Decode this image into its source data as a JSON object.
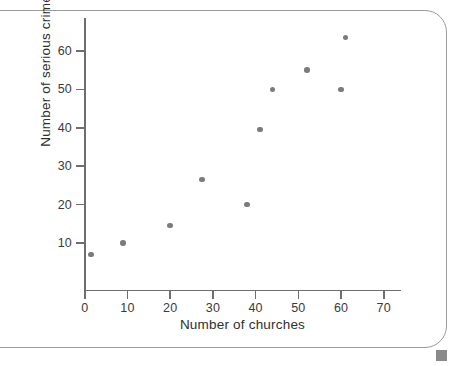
{
  "figure": {
    "frame": {
      "border_color": "#9b9b9b",
      "background": "#ffffff"
    },
    "corner_marker_color": "#8a8a8a"
  },
  "chart_data": {
    "type": "scatter",
    "title": "",
    "xlabel": "Number of churches",
    "ylabel": "Number of serious crimes",
    "xlim": [
      0,
      74
    ],
    "ylim": [
      0,
      68
    ],
    "xticks": [
      0,
      10,
      20,
      30,
      40,
      50,
      60,
      70
    ],
    "xtick_labels": [
      "0",
      "10",
      "20",
      "30",
      "40",
      "50",
      "60",
      "70"
    ],
    "yticks": [
      10,
      20,
      30,
      40,
      50,
      60
    ],
    "ytick_labels": [
      "10",
      "20",
      "30",
      "40",
      "50",
      "60"
    ],
    "grid": false,
    "legend": null,
    "marker_color": "#7b7b7f",
    "axis_color": "#6e6e6e",
    "points": [
      {
        "x": 1.5,
        "y": 7
      },
      {
        "x": 9,
        "y": 10
      },
      {
        "x": 20,
        "y": 14.5
      },
      {
        "x": 27.5,
        "y": 26.5
      },
      {
        "x": 38,
        "y": 20
      },
      {
        "x": 41,
        "y": 39.5
      },
      {
        "x": 44,
        "y": 50
      },
      {
        "x": 52,
        "y": 55
      },
      {
        "x": 60,
        "y": 50
      },
      {
        "x": 61,
        "y": 63.5
      }
    ]
  }
}
